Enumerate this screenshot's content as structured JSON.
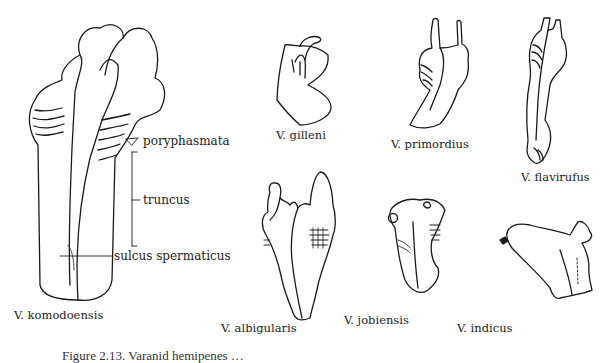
{
  "figure": {
    "caption_partial": "Figure 2.13. Varanid hemipenes …",
    "specimens": [
      {
        "id": "komodoensis",
        "label": "V. komodoensis"
      },
      {
        "id": "gilleni",
        "label": "V. gilleni"
      },
      {
        "id": "primordius",
        "label": "V. primordius"
      },
      {
        "id": "flavirufus",
        "label": "V. flavirufus"
      },
      {
        "id": "albigularis",
        "label": "V. albigularis"
      },
      {
        "id": "jobiensis",
        "label": "V. jobiensis"
      },
      {
        "id": "indicus",
        "label": "V. indicus"
      }
    ],
    "annotations": [
      {
        "id": "poryphasmata",
        "label": "poryphasmata"
      },
      {
        "id": "truncus",
        "label": "truncus"
      },
      {
        "id": "sulcus",
        "label": "sulcus spermaticus"
      }
    ]
  },
  "colors": {
    "ink": "#1a1a1a",
    "paper": "#ffffff",
    "stipple": "#9a9a9a"
  }
}
